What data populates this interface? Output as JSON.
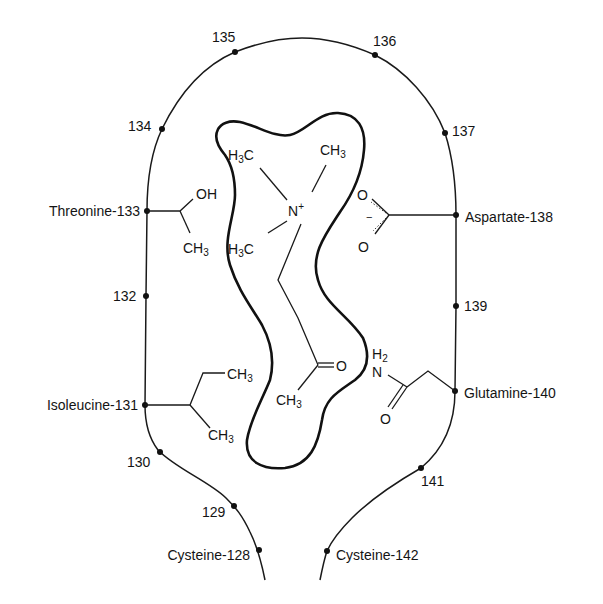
{
  "diagram": {
    "type": "binding-site schematic",
    "backbone_residues": [
      {
        "id": "128",
        "label": "Cysteine-128",
        "side": "left"
      },
      {
        "id": "129",
        "label": "129",
        "side": "left"
      },
      {
        "id": "130",
        "label": "130",
        "side": "left"
      },
      {
        "id": "131",
        "label": "Isoleucine-131",
        "side": "left"
      },
      {
        "id": "132",
        "label": "132",
        "side": "left"
      },
      {
        "id": "133",
        "label": "Threonine-133",
        "side": "left"
      },
      {
        "id": "134",
        "label": "134",
        "side": "left"
      },
      {
        "id": "135",
        "label": "135",
        "side": "top"
      },
      {
        "id": "136",
        "label": "136",
        "side": "top"
      },
      {
        "id": "137",
        "label": "137",
        "side": "right"
      },
      {
        "id": "138",
        "label": "Aspartate-138",
        "side": "right"
      },
      {
        "id": "139",
        "label": "139",
        "side": "right"
      },
      {
        "id": "140",
        "label": "Glutamine-140",
        "side": "right"
      },
      {
        "id": "141",
        "label": "141",
        "side": "right"
      },
      {
        "id": "142",
        "label": "Cysteine-142",
        "side": "right"
      }
    ],
    "side_chains": {
      "threonine": {
        "oh": "OH",
        "ch3": "CH",
        "ch3_sub": "3"
      },
      "isoleucine": {
        "ch3_a": "CH",
        "ch3_a_sub": "3",
        "ch3_b": "CH",
        "ch3_b_sub": "3"
      },
      "aspartate": {
        "o_top": "O",
        "o_bottom": "O",
        "charge": "−"
      },
      "glutamine": {
        "h2": "H",
        "h2_sub": "2",
        "n": "N",
        "o": "O"
      }
    },
    "ligand": {
      "name": "acetylcholine",
      "methyl_left_top": {
        "h": "H",
        "sub": "3",
        "c": "C"
      },
      "methyl_right_top": {
        "c": "CH",
        "sub": "3"
      },
      "methyl_left_bottom": {
        "h": "H",
        "sub": "3",
        "c": "C"
      },
      "nitrogen": "N",
      "nitrogen_charge": "+",
      "carbonyl_o": "O",
      "acetyl_methyl": {
        "c": "CH",
        "sub": "3"
      }
    }
  }
}
